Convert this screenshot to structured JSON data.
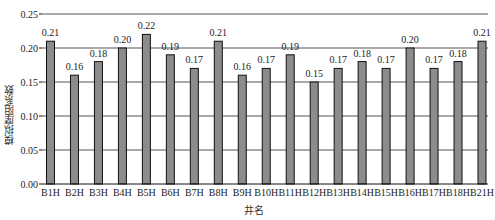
{
  "chart_data": {
    "type": "bar",
    "title": "",
    "xlabel": "井名",
    "ylabel": "模拟摩阻系数",
    "categories": [
      "B1H",
      "B2H",
      "B3H",
      "B4H",
      "B5H",
      "B6H",
      "B7H",
      "B8H",
      "B9H",
      "B10H",
      "B11H",
      "B12H",
      "B13H",
      "B14H",
      "B15H",
      "B16H",
      "B17H",
      "B18H",
      "B21H"
    ],
    "values": [
      0.21,
      0.16,
      0.18,
      0.2,
      0.22,
      0.19,
      0.17,
      0.21,
      0.16,
      0.17,
      0.19,
      0.15,
      0.17,
      0.18,
      0.17,
      0.2,
      0.17,
      0.18,
      0.21
    ],
    "data_labels": [
      "0.21",
      "0.16",
      "0.18",
      "0.20",
      "0.22",
      "0.19",
      "0.17",
      "0.21",
      "0.16",
      "0.17",
      "0.19",
      "0.15",
      "0.17",
      "0.18",
      "0.17",
      "0.20",
      "0.17",
      "0.18",
      "0.21"
    ],
    "ylim": [
      0,
      0.25
    ],
    "yticks": [
      "0.00",
      "0.05",
      "0.10",
      "0.15",
      "0.20",
      "0.25"
    ],
    "grid": true,
    "legend": null,
    "bar_color": "#8c8c8c",
    "bar_edge_color": "#111111",
    "grid_color": "#555555"
  }
}
